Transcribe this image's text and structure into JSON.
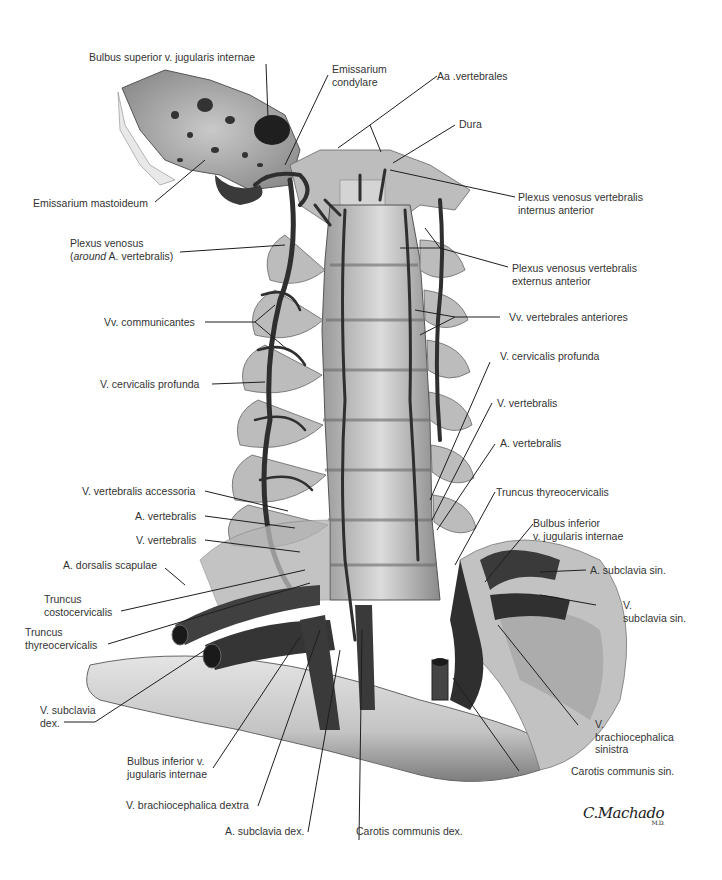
{
  "figure": {
    "type": "anatomical-illustration",
    "signature": {
      "name": "C.Machado",
      "suffix": "M.D."
    }
  },
  "labels": {
    "bulbus_superior": "Bulbus superior v. jugularis internae",
    "emissarium_condylare_1": "Emissarium",
    "emissarium_condylare_2": "condylare",
    "aa_vertebrales": "Aa .vertebrales",
    "dura": "Dura",
    "emissarium_mastoideum": "Emissarium mastoideum",
    "plexus_int_ant_1": "Plexus venosus vertebralis",
    "plexus_int_ant_2": "internus anterior",
    "plexus_venosus_1": "Plexus venosus",
    "plexus_venosus_2_paren_open": "(",
    "plexus_venosus_2_italic": "around",
    "plexus_venosus_2_rest": " A. vertebralis)",
    "plexus_ext_ant_1": "Plexus venosus vertebralis",
    "plexus_ext_ant_2": "externus anterior",
    "vv_communicantes": "Vv. communicantes",
    "vv_vertebrales_anteriores": "Vv. vertebrales anteriores",
    "v_cervicalis_profunda_left": "V. cervicalis profunda",
    "v_cervicalis_profunda_right": "V. cervicalis profunda",
    "v_vertebralis_right": "V. vertebralis",
    "a_vertebralis_right": "A. vertebralis",
    "v_vertebralis_accessoria": "V. vertebralis accessoria",
    "truncus_thyreocervicalis_right": "Truncus thyreocervicalis",
    "a_vertebralis_left": "A. vertebralis",
    "bulbus_inferior_right_1": "Bulbus inferior",
    "bulbus_inferior_right_2": "v. jugularis internae",
    "v_vertebralis_left": "V. vertebralis",
    "a_dorsalis_scapulae": "A. dorsalis scapulae",
    "a_subclavia_sin": "A. subclavia sin.",
    "truncus_costocervicalis_1": "Truncus",
    "truncus_costocervicalis_2": "costocervicalis",
    "v_subclavia_sin_1": "V.",
    "v_subclavia_sin_2": "subclavia sin.",
    "truncus_thyreocervicalis_left_1": "Truncus",
    "truncus_thyreocervicalis_left_2": "thyreocervicalis",
    "v_subclavia_dex_1": "V. subclavia",
    "v_subclavia_dex_2": "dex.",
    "v_brachiocephalica_sin_1": "V.",
    "v_brachiocephalica_sin_2": "brachiocephalica",
    "v_brachiocephalica_sin_3": "sinistra",
    "bulbus_inferior_left_1": "Bulbus inferior v.",
    "bulbus_inferior_left_2": "jugularis internae",
    "carotis_communis_sin": "Carotis communis sin.",
    "v_brachiocephalica_dextra": "V. brachiocephalica dextra",
    "a_subclavia_dex": "A. subclavia dex.",
    "carotis_communis_dex": "Carotis communis dex."
  },
  "colors": {
    "background": "#ffffff",
    "bone_light": "#d8d8d8",
    "bone_mid": "#a9a9a9",
    "vessel_dark": "#3a3a3a",
    "leader_line": "#1e1e1e",
    "text": "#333333"
  }
}
